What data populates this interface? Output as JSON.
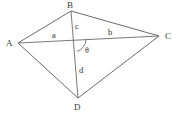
{
  "figure": {
    "type": "geometry-diagram",
    "background_color": "#ffffff",
    "line_color": "#5a5a5a"
  },
  "vertices": [
    {
      "id": "A",
      "label": "A",
      "label_x": 6,
      "label_y": 46,
      "x": 18,
      "y": 43
    },
    {
      "id": "B",
      "label": "B",
      "label_x": 67,
      "label_y": 8,
      "x": 71,
      "y": 11
    },
    {
      "id": "C",
      "label": "C",
      "label_x": 165,
      "label_y": 39,
      "x": 159,
      "y": 36
    },
    {
      "id": "D",
      "label": "D",
      "label_x": 74,
      "label_y": 110,
      "x": 78,
      "y": 98
    }
  ],
  "intersection": {
    "id": "O",
    "x": 73,
    "y": 39
  },
  "edges": [
    {
      "id": "AB",
      "from": "A",
      "to": "B"
    },
    {
      "id": "BC",
      "from": "B",
      "to": "C"
    },
    {
      "id": "CD",
      "from": "C",
      "to": "D"
    },
    {
      "id": "DA",
      "from": "D",
      "to": "A"
    }
  ],
  "diagonals": [
    {
      "id": "AC",
      "from": "A",
      "to": "C"
    },
    {
      "id": "BD",
      "from": "B",
      "to": "D"
    }
  ],
  "segment_labels": [
    {
      "id": "a",
      "label": "a",
      "x": 52,
      "y": 38,
      "segment": "A-O (part of diagonal AC)"
    },
    {
      "id": "b",
      "label": "b",
      "x": 108,
      "y": 35,
      "segment": "O-C (part of diagonal AC)"
    },
    {
      "id": "c",
      "label": "c",
      "x": 75,
      "y": 29,
      "segment": "B-O (part of diagonal BD)"
    },
    {
      "id": "d",
      "label": "d",
      "x": 79,
      "y": 73,
      "segment": "O-D (part of diagonal BD)"
    }
  ],
  "angle": {
    "id": "theta",
    "label": "θ",
    "label_x": 85,
    "label_y": 53,
    "vertex": "O",
    "between": "diagonal OC and diagonal OD",
    "arc": {
      "radius": 13,
      "start_x": 86,
      "start_y": 39,
      "end_x": 77,
      "end_y": 51
    }
  }
}
